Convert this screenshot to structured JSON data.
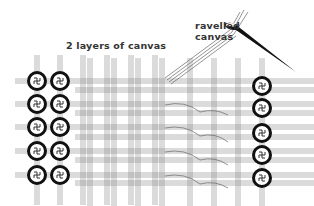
{
  "diagram": {
    "labels": {
      "layers": "2 layers of canvas",
      "ravelled_line1": "ravelled",
      "ravelled_line2": "canvas"
    },
    "elements": {
      "left_knots": {
        "columns": [
          37,
          60
        ],
        "rows": [
          81,
          104,
          127,
          151,
          175
        ]
      },
      "right_knots": {
        "column": 262,
        "rows": [
          86,
          108,
          133,
          155,
          178
        ]
      },
      "needle": "needle-icon"
    },
    "colors": {
      "ink": "#111111",
      "thread": "#777777",
      "background": "#ffffff"
    }
  }
}
